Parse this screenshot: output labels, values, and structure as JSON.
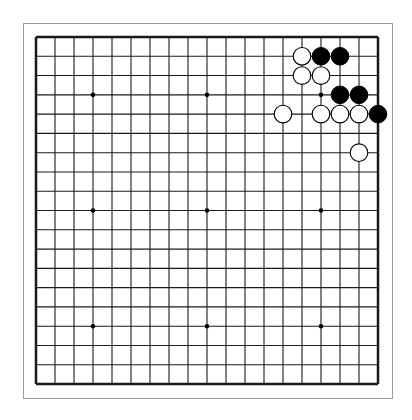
{
  "board": {
    "size": 19,
    "origin": {
      "x": 36,
      "y": 37
    },
    "spacing": {
      "x": 19.0,
      "y": 19.28
    },
    "line_color": "#1a1a1a",
    "edge_width": 2.5,
    "star_points": [
      [
        3,
        3
      ],
      [
        9,
        3
      ],
      [
        15,
        3
      ],
      [
        3,
        9
      ],
      [
        9,
        9
      ],
      [
        15,
        9
      ],
      [
        3,
        15
      ],
      [
        9,
        15
      ],
      [
        15,
        15
      ]
    ],
    "stones": {
      "black": [
        [
          15,
          1
        ],
        [
          16,
          1
        ],
        [
          16,
          3
        ],
        [
          17,
          3
        ],
        [
          18,
          4
        ]
      ],
      "white": [
        [
          14,
          1
        ],
        [
          14,
          2
        ],
        [
          15,
          2
        ],
        [
          13,
          4
        ],
        [
          15,
          4
        ],
        [
          16,
          4
        ],
        [
          17,
          4
        ],
        [
          17,
          6
        ]
      ]
    },
    "colors": {
      "black": "#000000",
      "white": "#ffffff",
      "outline": "#000000"
    }
  }
}
